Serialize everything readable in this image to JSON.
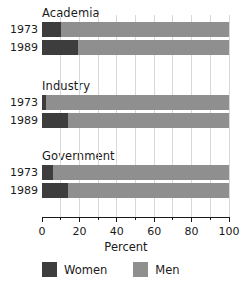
{
  "chart_data": {
    "type": "bar",
    "orientation": "horizontal",
    "stacked": true,
    "stacked_total": 100,
    "title": "",
    "xlabel": "Percent",
    "ylabel": "",
    "xlim": [
      0,
      100
    ],
    "xticks": [
      0,
      20,
      40,
      60,
      80,
      100
    ],
    "xtick_labels": [
      "0",
      "20",
      "40",
      "60",
      "80",
      "100"
    ],
    "minor_xticks": [
      10,
      30,
      50,
      70,
      90
    ],
    "gridlines": [
      10,
      20,
      30,
      40,
      50,
      60,
      70,
      80,
      90,
      100
    ],
    "grid": true,
    "legend_position": "bottom",
    "groups": [
      "Academia",
      "Industry",
      "Government"
    ],
    "categories": [
      "Academia 1973",
      "Academia 1989",
      "Industry 1973",
      "Industry 1989",
      "Government 1973",
      "Government 1989"
    ],
    "series": [
      {
        "name": "Women",
        "color": "#3d3d3d",
        "values": [
          10,
          19,
          2,
          14,
          6,
          14
        ]
      },
      {
        "name": "Men",
        "color": "#8f8f8f",
        "values": [
          90,
          81,
          98,
          86,
          94,
          86
        ]
      }
    ],
    "panels": [
      {
        "title": "Academia",
        "rows": [
          {
            "year": "1973",
            "women": 10,
            "men": 90
          },
          {
            "year": "1989",
            "women": 19,
            "men": 81
          }
        ]
      },
      {
        "title": "Industry",
        "rows": [
          {
            "year": "1973",
            "women": 2,
            "men": 98
          },
          {
            "year": "1989",
            "women": 14,
            "men": 86
          }
        ]
      },
      {
        "title": "Government",
        "rows": [
          {
            "year": "1973",
            "women": 6,
            "men": 94
          },
          {
            "year": "1989",
            "women": 14,
            "men": 86
          }
        ]
      }
    ]
  },
  "legend": {
    "items": [
      {
        "label": "Women",
        "color": "#3d3d3d"
      },
      {
        "label": "Men",
        "color": "#8f8f8f"
      }
    ]
  },
  "colors": {
    "women": "#3d3d3d",
    "men": "#8f8f8f",
    "gridline": "#d8d8d8",
    "axis": "#1a1a1a",
    "text": "#1a1a1a",
    "background": "#ffffff"
  }
}
